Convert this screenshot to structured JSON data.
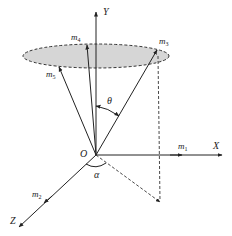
{
  "diagram": {
    "type": "3d-vector-cone",
    "axes": {
      "x_label": "X",
      "y_label": "Y",
      "z_label": "Z",
      "origin_label": "O"
    },
    "vectors": [
      {
        "name": "m",
        "sub": "1",
        "along": "X axis"
      },
      {
        "name": "m",
        "sub": "2",
        "along": "Z axis"
      },
      {
        "name": "m",
        "sub": "3",
        "along": "cone edge"
      },
      {
        "name": "m",
        "sub": "4",
        "along": "cone edge"
      },
      {
        "name": "m",
        "sub": "5",
        "along": "cone edge"
      }
    ],
    "angles": {
      "theta": "θ",
      "alpha": "α"
    },
    "colors": {
      "line": "#222222",
      "disk_fill": "#d6d6d6",
      "background": "#ffffff"
    }
  }
}
